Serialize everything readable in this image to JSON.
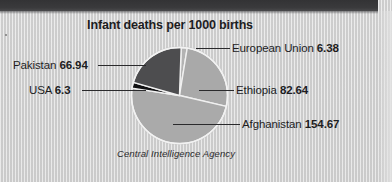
{
  "chart_data": {
    "type": "pie",
    "title": "Infant deaths per 1000 births",
    "source": "Central Intelligence Agency",
    "unit": "deaths per 1000 live births",
    "categories": [
      "Afghanistan",
      "Ethiopia",
      "Pakistan",
      "European Union",
      "USA"
    ],
    "values": [
      154.67,
      82.64,
      66.94,
      6.38,
      6.3
    ],
    "total": 316.93,
    "labels": [
      {
        "name": "European Union",
        "value": "6.38",
        "numeric": 6.38,
        "color": "#b3b3b3",
        "position": "right-top"
      },
      {
        "name": "Ethiopia",
        "value": "82.64",
        "numeric": 82.64,
        "color": "#a9a9a9",
        "position": "right-middle"
      },
      {
        "name": "Afghanistan",
        "value": "154.67",
        "numeric": 154.67,
        "color": "#aaaaaa",
        "position": "right-bottom"
      },
      {
        "name": "Pakistan",
        "value": "66.94",
        "numeric": 66.94,
        "color": "#4d4d4f",
        "position": "left-top"
      },
      {
        "name": "USA",
        "value": "6.3",
        "numeric": 6.3,
        "color": "#111113",
        "position": "left-middle"
      }
    ],
    "slice_order": [
      "European Union",
      "Ethiopia",
      "Afghanistan",
      "USA",
      "Pakistan"
    ],
    "start_angle_deg": -88,
    "legend": "none",
    "grid": false,
    "xlabel": "",
    "ylabel": ""
  },
  "style": {
    "background": "#d2d2d2",
    "top_band": "#37373a",
    "title_color": "#1d1d1f",
    "slice_outline": "#f0f0f0",
    "leader_color": "#2a2a2c"
  }
}
